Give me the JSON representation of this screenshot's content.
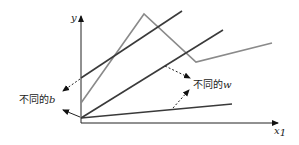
{
  "diagram": {
    "type": "linear-functions-illustration",
    "axes": {
      "x_label": "x",
      "x_label_subscript": "1",
      "y_label": "y"
    },
    "annotations": {
      "different_b": {
        "text": "不同的",
        "var": "b"
      },
      "different_w": {
        "text": "不同的",
        "var": "w"
      }
    },
    "colors": {
      "dark_line": "#3a3a3a",
      "gray_line": "#8a8a8a",
      "axis": "#222222"
    },
    "lines": [
      {
        "name": "line-high-intercept",
        "color": "dark",
        "from": [
          81,
          78
        ],
        "to": [
          182,
          11
        ]
      },
      {
        "name": "line-origin-steep",
        "color": "dark",
        "from": [
          81,
          118
        ],
        "to": [
          223,
          30
        ]
      },
      {
        "name": "line-origin-shallow",
        "color": "dark",
        "from": [
          81,
          118
        ],
        "to": [
          232,
          104
        ]
      },
      {
        "name": "piecewise-gray",
        "color": "gray",
        "points": [
          [
            81,
            103
          ],
          [
            144,
            14
          ],
          [
            196,
            62
          ],
          [
            272,
            43
          ]
        ]
      }
    ]
  }
}
